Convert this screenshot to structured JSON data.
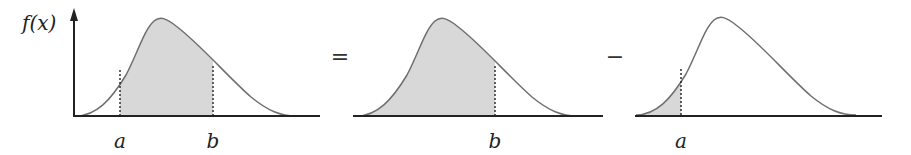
{
  "y_axis_label": "f(x)",
  "operators": {
    "equals": "=",
    "minus": "−"
  },
  "colors": {
    "shade": "#d8d8d8",
    "curve": "#6f6f6f",
    "axis": "#222222"
  },
  "panels": [
    {
      "name": "interval-a-to-b",
      "shaded_region": "between a and b",
      "labels": [
        {
          "text": "a",
          "x": 120
        },
        {
          "text": "b",
          "x": 213
        }
      ]
    },
    {
      "name": "cumulative-up-to-b",
      "shaded_region": "left of b",
      "labels": [
        {
          "text": "b",
          "x": 495
        }
      ]
    },
    {
      "name": "cumulative-up-to-a",
      "shaded_region": "left of a",
      "labels": [
        {
          "text": "a",
          "x": 681
        }
      ]
    }
  ]
}
